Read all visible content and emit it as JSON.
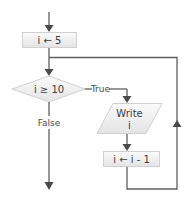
{
  "flowchart": {
    "nodes": {
      "init": {
        "type": "process",
        "label": "i ← 5"
      },
      "condition": {
        "type": "decision",
        "label": "i ≥ 10"
      },
      "output": {
        "type": "io",
        "label_line1": "Write",
        "label_line2": "i"
      },
      "decrement": {
        "type": "process",
        "label": "i ← i - 1"
      }
    },
    "edges": {
      "true_label": "True",
      "false_label": "False"
    },
    "colors": {
      "line": "#5f5f5f",
      "arrowhead": "#4a4a4a",
      "shape_fill_top": "#fafafa",
      "shape_fill_bottom": "#e6e6e6",
      "shape_border": "#d0d0d0",
      "text": "#3c3c3c"
    }
  }
}
